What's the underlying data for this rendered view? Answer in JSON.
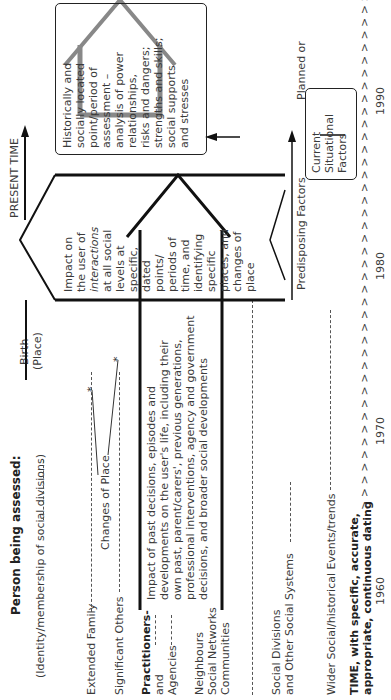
{
  "left_labels": {
    "person_title": "Person being assessed:",
    "person_sub": "(Identity/membership of social divisions)",
    "extended_family": "Extended Family",
    "significant_others": "Significant Others",
    "practitioners": "Practitioners-",
    "and": "and",
    "agencies": "Agencies",
    "neighbours": "Neighbours",
    "social_networks": "Social Networks",
    "communities": "Communities",
    "social_divisions": "Social Divisions",
    "other_systems": "and Other Social Systems",
    "wider_social": "Wider Social/historical Events/trends",
    "time_line1": "TIME, with specific, accurate,",
    "time_line2": "appropriate, continuous dating"
  },
  "annotations": {
    "birth": "Birth",
    "birth_place": "(Place)",
    "changes_of_place": "Changes of Place",
    "present_time": "PRESENT TIME",
    "predisposing_factors": "Predisposing Factors"
  },
  "boxes": {
    "past_impact": [
      "Impact of past decisions, episodes and",
      "developments on the user's life, including their",
      "own past, parent/carers', previous generations,",
      "professional interventions, agency and government",
      "decisions, and broader social developments"
    ],
    "interactions": [
      "Impact on",
      "the user of",
      "interactions",
      "at all social",
      "levels at",
      "specific,",
      "dated",
      "points/",
      "periods of",
      "time, and",
      "identifying",
      "specific",
      "places, and",
      "changes of",
      "place"
    ],
    "assessment": [
      "Historically and",
      "socially located",
      "point/period of",
      "assessment –",
      "analysis of power",
      "relationships,",
      "risks and dangers;",
      "strengths and skills;",
      "social supports",
      "and stresses"
    ],
    "future": [
      "Planned or",
      "Probable",
      "Future",
      "Events/ trends"
    ],
    "situational": [
      "Current",
      "Situational",
      "Factors"
    ]
  },
  "timeline": {
    "arrows": "> > > > > > > > > > > > > > > > > > > > > > > > > > > > > > > > > > > > > > > > > > > > > >",
    "years": [
      "1960",
      "1970",
      "1980",
      "1990"
    ]
  }
}
